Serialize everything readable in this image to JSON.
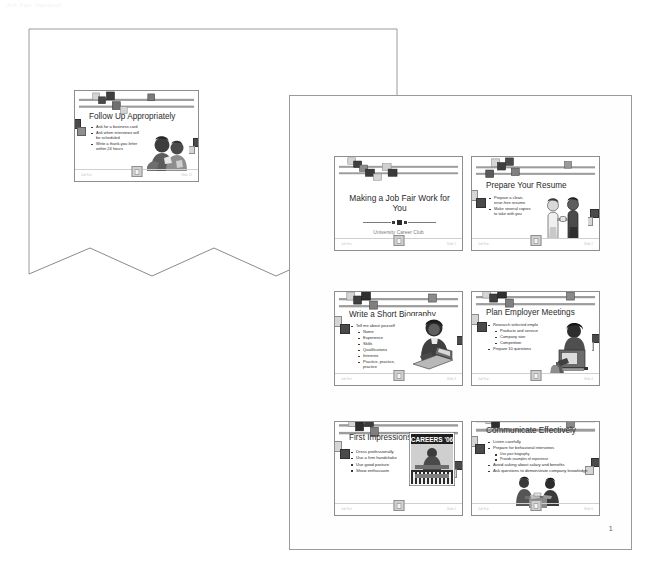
{
  "document": {
    "scan_artifact_text": "Job Fair Handout",
    "page_number": "1"
  },
  "back_page": {
    "name": "torn-handout-page",
    "slides": [
      {
        "id": "follow-up-appropriately",
        "title": "Follow Up Appropriately",
        "bullets": [
          {
            "text": "Ask for a business card",
            "level": 1
          },
          {
            "text": "Ask when interviews will be scheduled",
            "level": 1
          },
          {
            "text": "Write a thank-you letter within 24 hours",
            "level": 1
          }
        ],
        "clipart": "two-men-talking",
        "footer_left": "Job Fair",
        "footer_right": "Slide 12"
      }
    ]
  },
  "front_page": {
    "name": "handout-page-1",
    "slides": [
      {
        "id": "title-slide",
        "kind": "title",
        "title": "Making a Job Fair Work for You",
        "subtitle": "University Career Club",
        "footer_left": "Job Fair",
        "footer_right": "Slide 1"
      },
      {
        "id": "prepare-your-resume",
        "kind": "bullets",
        "title": "Prepare Your Resume",
        "bullets": [
          {
            "text": "Prepare a clean, error-free resume",
            "level": 1
          },
          {
            "text": "Make several copies to take with you",
            "level": 1
          }
        ],
        "clipart": "handshake-two-people",
        "footer_left": "Job Fair",
        "footer_right": "Slide 2"
      },
      {
        "id": "write-a-short-biography",
        "kind": "bullets",
        "title": "Write a Short Biography",
        "bullets": [
          {
            "text": "Tell me about yourself",
            "level": 1
          },
          {
            "text": "Name",
            "level": 2
          },
          {
            "text": "Experience",
            "level": 2
          },
          {
            "text": "Skills",
            "level": 2
          },
          {
            "text": "Qualifications",
            "level": 2
          },
          {
            "text": "Interests",
            "level": 2
          },
          {
            "text": "Practice, practice, practice",
            "level": 2
          }
        ],
        "clipart": "woman-at-laptop",
        "footer_left": "Job Fair",
        "footer_right": "Slide 3"
      },
      {
        "id": "plan-employer-meetings",
        "kind": "bullets",
        "title": "Plan Employer Meetings",
        "bullets": [
          {
            "text": "Research selected employers",
            "level": 1
          },
          {
            "text": "Products and services",
            "level": 2
          },
          {
            "text": "Company size",
            "level": 2
          },
          {
            "text": "Competition",
            "level": 2
          },
          {
            "text": "Prepare 10 questions",
            "level": 1
          }
        ],
        "clipart": "person-at-desk-computer",
        "footer_left": "Job Fair",
        "footer_right": "Slide 4"
      },
      {
        "id": "first-impressions",
        "kind": "bullets",
        "title": "First Impressions",
        "bullets": [
          {
            "text": "Dress professionally",
            "level": 1
          },
          {
            "text": "Use a firm handshake",
            "level": 1
          },
          {
            "text": "Use good posture",
            "level": 1
          },
          {
            "text": "Show enthusiasm",
            "level": 1
          }
        ],
        "clipart": "job-fair-booth-sign",
        "clipart_sign": "CAREERS '06",
        "footer_left": "Job Fair",
        "footer_right": "Slide 5"
      },
      {
        "id": "communicate-effectively",
        "kind": "bullets",
        "title": "Communicate Effectively",
        "bullets": [
          {
            "text": "Listen carefully",
            "level": 1
          },
          {
            "text": "Prepare for behavioral interviews",
            "level": 1
          },
          {
            "text": "Use your biography",
            "level": 2
          },
          {
            "text": "Provide examples of experience",
            "level": 2
          },
          {
            "text": "Avoid asking about salary and benefits",
            "level": 1
          },
          {
            "text": "Ask questions to demonstrate company knowledge",
            "level": 1
          }
        ],
        "clipart": "two-people-at-table",
        "footer_left": "Job Fair",
        "footer_right": "Slide 6"
      }
    ]
  },
  "colors": {
    "paper": "#ffffff",
    "page_border": "#9a9a9a",
    "slide_border": "#8d8d8d",
    "text": "#2b2b2b",
    "muted": "#7b7b7b",
    "deco_dark": "#4a4a4a",
    "deco_mid": "#8f8f8f",
    "deco_light": "#d5d5d5"
  }
}
